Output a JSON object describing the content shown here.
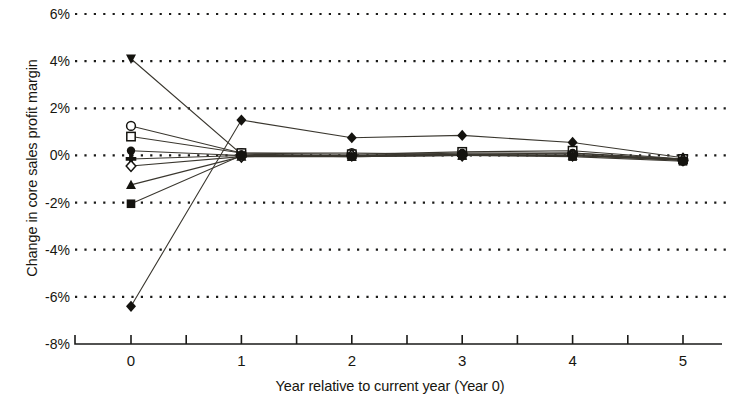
{
  "chart_data": {
    "type": "line",
    "title": "",
    "xlabel": "Year relative to current year (Year 0)",
    "ylabel": "Change in core sales profit margin",
    "x": [
      0,
      1,
      2,
      3,
      4,
      5
    ],
    "xtick_labels": [
      "0",
      "1",
      "2",
      "3",
      "4",
      "5"
    ],
    "ytick_labels": [
      "6%",
      "4%",
      "2%",
      "0%",
      "-2%",
      "-4%",
      "-6%",
      "-8%"
    ],
    "ytick_values": [
      6,
      4,
      2,
      0,
      -2,
      -4,
      -6,
      -8
    ],
    "ylim": [
      -8,
      6
    ],
    "xlim": [
      -0.35,
      5.6
    ],
    "grid": "horizontal-dotted",
    "legend": "none",
    "value_unit": "percent",
    "series": [
      {
        "name": "series-1",
        "marker": "triangle-down-filled",
        "values": [
          4.1,
          0.05,
          0.0,
          0.05,
          0.0,
          -0.15
        ]
      },
      {
        "name": "series-2",
        "marker": "diamond-filled",
        "values": [
          -6.4,
          1.5,
          0.75,
          0.85,
          0.55,
          -0.1
        ]
      },
      {
        "name": "series-3",
        "marker": "circle-open",
        "values": [
          1.25,
          0.1,
          0.1,
          0.05,
          0.1,
          -0.15
        ]
      },
      {
        "name": "series-4",
        "marker": "square-open",
        "values": [
          0.8,
          0.1,
          0.05,
          0.15,
          0.2,
          -0.15
        ]
      },
      {
        "name": "series-5",
        "marker": "circle-filled",
        "values": [
          0.2,
          0.0,
          0.0,
          0.1,
          0.1,
          -0.2
        ]
      },
      {
        "name": "series-6",
        "marker": "cross-filled",
        "values": [
          -0.15,
          0.0,
          0.0,
          0.05,
          0.05,
          -0.2
        ]
      },
      {
        "name": "series-7",
        "marker": "diamond-open",
        "values": [
          -0.45,
          -0.05,
          0.0,
          0.0,
          0.0,
          -0.2
        ]
      },
      {
        "name": "series-8",
        "marker": "triangle-up-filled",
        "values": [
          -1.25,
          -0.05,
          -0.05,
          0.0,
          0.0,
          -0.2
        ]
      },
      {
        "name": "series-9",
        "marker": "square-filled",
        "values": [
          -2.05,
          0.0,
          -0.05,
          0.0,
          -0.05,
          -0.25
        ]
      }
    ]
  },
  "axis": {
    "x_axis_name": "x-axis",
    "y_axis_name": "y-axis"
  }
}
